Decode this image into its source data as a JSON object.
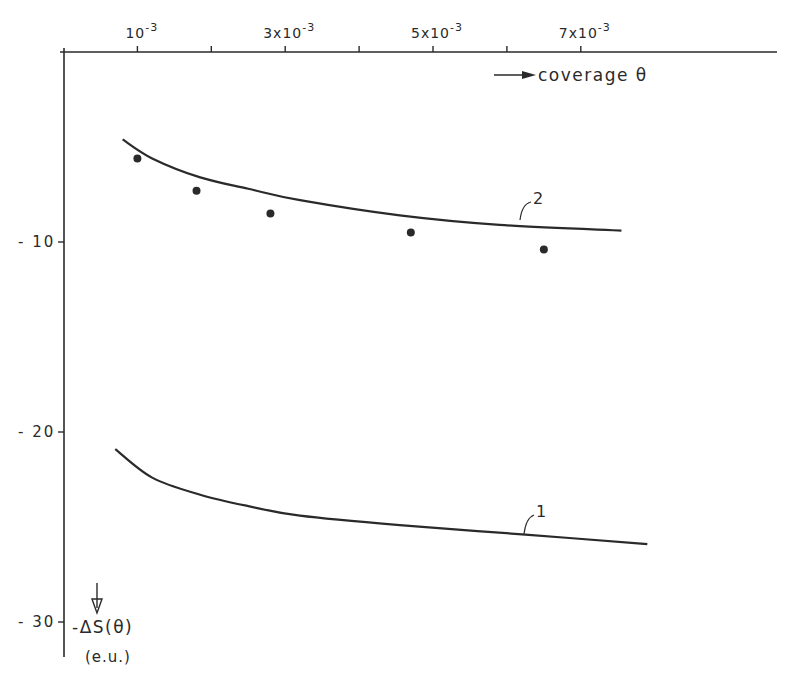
{
  "chart_data": {
    "type": "line",
    "title": "",
    "xlabel": "coverage θ",
    "ylabel": "-ΔS(θ)",
    "ylabel_unit": "(e.u.)",
    "x_axis_position": "top",
    "y_axis_inverted": true,
    "xlim": [
      0,
      0.0096
    ],
    "ylim": [
      0,
      -33
    ],
    "grid": false,
    "x_ticks": [
      0.001,
      0.002,
      0.003,
      0.004,
      0.005,
      0.006,
      0.007
    ],
    "x_tick_labels": [
      "10",
      "",
      "3x10",
      "",
      "5x10",
      "",
      "7x10"
    ],
    "x_tick_exp": [
      "-3",
      "",
      "-3",
      "",
      "-3",
      "",
      "-3"
    ],
    "y_ticks": [
      -10,
      -20,
      -30
    ],
    "y_tick_labels": [
      "- 10",
      "- 20",
      "- 30"
    ],
    "series": [
      {
        "name": "1",
        "style": "line",
        "x": [
          0.0007,
          0.0012,
          0.00185,
          0.0025,
          0.0032,
          0.00455,
          0.00625,
          0.0079
        ],
        "y": [
          -20.9,
          -22.4,
          -23.3,
          -23.9,
          -24.4,
          -24.9,
          -25.4,
          -25.9
        ]
      },
      {
        "name": "2",
        "style": "line",
        "x": [
          0.0008,
          0.0012,
          0.00185,
          0.0025,
          0.0032,
          0.00455,
          0.0059,
          0.00755
        ],
        "y": [
          -4.6,
          -5.6,
          -6.6,
          -7.2,
          -7.8,
          -8.6,
          -9.1,
          -9.4
        ]
      },
      {
        "name": "experimental",
        "style": "points",
        "x": [
          0.001,
          0.0018,
          0.0028,
          0.0047,
          0.0065
        ],
        "y": [
          -5.6,
          -7.3,
          -8.5,
          -9.5,
          -10.4
        ]
      }
    ],
    "annotations": [
      "1",
      "2",
      "→ coverage θ",
      "↓ -ΔS(θ) (e.u.)"
    ]
  },
  "labels": {
    "x_axis": "coverage θ",
    "y_axis": "-ΔS(θ)",
    "y_unit": "(e.u.)",
    "curve1": "1",
    "curve2": "2"
  },
  "colors": {
    "ink": "#2a2a2a",
    "background": "#ffffff"
  }
}
